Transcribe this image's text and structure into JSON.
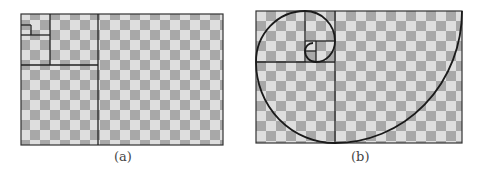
{
  "figure": {
    "panels": [
      {
        "id": "a",
        "caption": "(a)",
        "description": "Checkerboard with nested golden-ratio rectangles"
      },
      {
        "id": "b",
        "caption": "(b)",
        "description": "Checkerboard with golden-ratio rectangles and Fibonacci spiral"
      }
    ],
    "colors": {
      "checker_dark": "#a8a8a8",
      "checker_light": "#dedede",
      "line": "#222222"
    }
  }
}
